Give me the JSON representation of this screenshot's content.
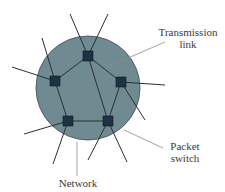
{
  "diagram": {
    "labels": {
      "transmission_link_line1": "Transmission",
      "transmission_link_line2": "link",
      "packet_switch_line1": "Packet",
      "packet_switch_line2": "switch",
      "network": "Network"
    },
    "colors": {
      "network_fill": "#6f8b91",
      "network_stroke": "#3c4d52",
      "switch_fill": "#1d3242",
      "link": "#2a2f33",
      "leader": "#8a8a8a"
    },
    "network_circle": {
      "cx": 88,
      "cy": 88,
      "r": 52
    },
    "switches": [
      {
        "id": "top",
        "x": 88,
        "y": 56
      },
      {
        "id": "left",
        "x": 55,
        "y": 81
      },
      {
        "id": "right",
        "x": 121,
        "y": 82
      },
      {
        "id": "bottom-left",
        "x": 68,
        "y": 121
      },
      {
        "id": "bottom-right",
        "x": 108,
        "y": 121
      }
    ]
  }
}
